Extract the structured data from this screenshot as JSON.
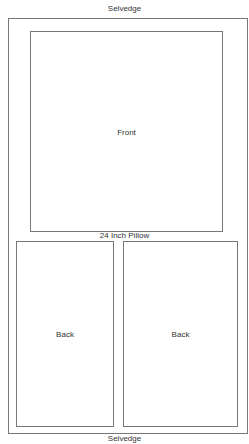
{
  "diagram": {
    "title_top": "Selvedge",
    "title_bottom": "Selvedge",
    "middle_label": "24 Inch Pillow",
    "pieces": [
      {
        "label": "Front"
      },
      {
        "label": "Back"
      },
      {
        "label": "Back"
      }
    ],
    "line_color": "#777777"
  }
}
